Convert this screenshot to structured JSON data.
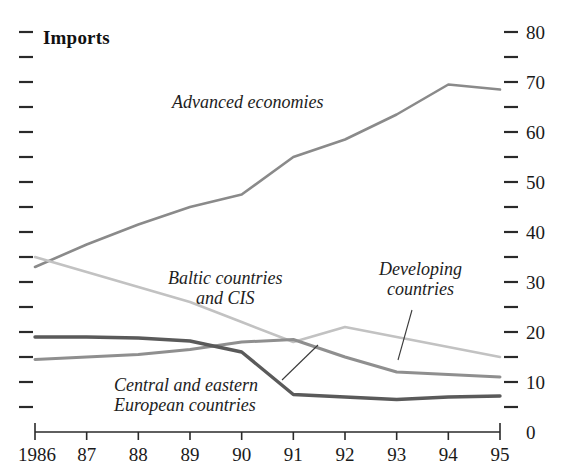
{
  "chart_data": {
    "type": "line",
    "title": "Imports",
    "xlabel": "",
    "ylabel": "",
    "x": [
      1986,
      1987,
      1988,
      1989,
      1990,
      1991,
      1992,
      1993,
      1994,
      1995
    ],
    "tick_labels_x": [
      "1986",
      "87",
      "88",
      "89",
      "90",
      "91",
      "92",
      "93",
      "94",
      "95"
    ],
    "tick_labels_y": [
      "0",
      "10",
      "20",
      "30",
      "40",
      "50",
      "60",
      "70",
      "80"
    ],
    "ylim": [
      0,
      80
    ],
    "y_major_step": 10,
    "y_minor_step": 5,
    "grid": false,
    "legend_position": "inline-annotations",
    "axis_labels_side": "right",
    "series": [
      {
        "name": "Advanced economies",
        "color": "#8a8a8a",
        "width": 2.6,
        "values": [
          33.0,
          37.5,
          41.5,
          45.0,
          47.5,
          55.0,
          58.5,
          63.5,
          69.5,
          68.5
        ]
      },
      {
        "name": "Baltic countries and CIS",
        "color": "#c2c2c2",
        "width": 2.6,
        "values": [
          35.0,
          32.0,
          29.0,
          26.0,
          22.0,
          18.0,
          21.0,
          19.0,
          17.0,
          15.0
        ]
      },
      {
        "name": "Developing countries",
        "color": "#8f8f8f",
        "width": 3.0,
        "values": [
          14.5,
          15.0,
          15.5,
          16.5,
          18.0,
          18.5,
          15.0,
          12.0,
          11.5,
          11.0
        ]
      },
      {
        "name": "Central and eastern European countries",
        "color": "#5a5a5a",
        "width": 3.4,
        "values": [
          19.0,
          19.0,
          18.8,
          18.2,
          16.0,
          7.5,
          7.0,
          6.5,
          7.0,
          7.2
        ]
      }
    ],
    "annotations": [
      {
        "text": "Advanced economies",
        "x_px": 172,
        "y_px": 92,
        "align": "left"
      },
      {
        "text": "Baltic countries\nand CIS",
        "x_px": 168,
        "y_px": 268,
        "align": "center"
      },
      {
        "text": "Developing\ncountries",
        "x_px": 379,
        "y_px": 259,
        "align": "center"
      },
      {
        "text": "Central and eastern\nEuropean countries",
        "x_px": 114,
        "y_px": 375,
        "align": "left"
      }
    ],
    "leader_lines": [
      {
        "from_x_px": 412,
        "from_y_px": 310,
        "to_x_px": 398,
        "to_y_px": 360
      },
      {
        "from_x_px": 282,
        "from_y_px": 380,
        "to_x_px": 318,
        "to_y_px": 345
      }
    ]
  }
}
